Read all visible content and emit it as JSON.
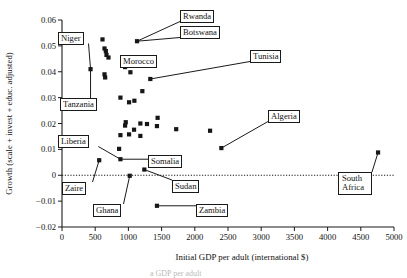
{
  "figure": {
    "type": "scatter-plot",
    "background": "#ffffff",
    "marker_color": "#161616",
    "axis_color": "#1a1a1a",
    "bottom_caption": "a GDP per adult"
  },
  "chart_data": {
    "type": "scatter",
    "title": "",
    "xlabel": "Initial GDP per adult (international $)",
    "ylabel": "Growth (scale + invest + educ. adjusted)",
    "xlim": [
      0,
      5000
    ],
    "ylim": [
      -0.02,
      0.06
    ],
    "xticks": [
      0,
      500,
      1000,
      1500,
      2000,
      2500,
      3000,
      3500,
      4000,
      4500,
      5000
    ],
    "xtick_labels": [
      "0",
      "500",
      "1000",
      "1500",
      "2000",
      "2500",
      "3000",
      "3500",
      "4000",
      "4500",
      "5000"
    ],
    "yticks": [
      -0.02,
      -0.01,
      0,
      0.01,
      0.02,
      0.03,
      0.04,
      0.05,
      0.06
    ],
    "ytick_labels": [
      "−0.02",
      "−0.01",
      "0",
      "0.01",
      "0.02",
      "0.03",
      "0.04",
      "0.05",
      "0.06"
    ],
    "grid": false,
    "legend": "none",
    "reference_line": {
      "y": 0,
      "style": "dotted"
    },
    "points": [
      {
        "x": 610,
        "y": 0.0525
      },
      {
        "x": 640,
        "y": 0.049
      },
      {
        "x": 660,
        "y": 0.048
      },
      {
        "x": 670,
        "y": 0.0465
      },
      {
        "x": 700,
        "y": 0.0455
      },
      {
        "x": 430,
        "y": 0.041
      },
      {
        "x": 640,
        "y": 0.039
      },
      {
        "x": 650,
        "y": 0.0378
      },
      {
        "x": 1130,
        "y": 0.0518
      },
      {
        "x": 1290,
        "y": 0.0455
      },
      {
        "x": 1110,
        "y": 0.0432
      },
      {
        "x": 950,
        "y": 0.0418
      },
      {
        "x": 1030,
        "y": 0.0398
      },
      {
        "x": 1330,
        "y": 0.0372
      },
      {
        "x": 1210,
        "y": 0.0325
      },
      {
        "x": 880,
        "y": 0.03
      },
      {
        "x": 1090,
        "y": 0.0288
      },
      {
        "x": 1010,
        "y": 0.0282
      },
      {
        "x": 1440,
        "y": 0.0222
      },
      {
        "x": 960,
        "y": 0.0205
      },
      {
        "x": 1180,
        "y": 0.02
      },
      {
        "x": 1280,
        "y": 0.0198
      },
      {
        "x": 950,
        "y": 0.0192
      },
      {
        "x": 1430,
        "y": 0.019
      },
      {
        "x": 1085,
        "y": 0.0176
      },
      {
        "x": 1720,
        "y": 0.0178
      },
      {
        "x": 2230,
        "y": 0.0172
      },
      {
        "x": 1010,
        "y": 0.0158
      },
      {
        "x": 1180,
        "y": 0.0152
      },
      {
        "x": 880,
        "y": 0.0155
      },
      {
        "x": 860,
        "y": 0.0102
      },
      {
        "x": 880,
        "y": 0.0062
      },
      {
        "x": 560,
        "y": 0.0058
      },
      {
        "x": 1240,
        "y": 0.0022
      },
      {
        "x": 1020,
        "y": -0.0002
      },
      {
        "x": 2400,
        "y": 0.0105
      },
      {
        "x": 1430,
        "y": -0.0118
      },
      {
        "x": 4760,
        "y": 0.0088
      }
    ],
    "annotations": [
      {
        "label": "Rwanda",
        "box_x": 180,
        "box_y": 10,
        "target_x": 1130,
        "target_y": 0.0518,
        "lines": 1
      },
      {
        "label": "Botswana",
        "box_x": 180,
        "box_y": 26,
        "target_x": 1130,
        "target_y": 0.0518,
        "lines": 1
      },
      {
        "label": "Niger",
        "box_x": 58,
        "box_y": 32,
        "target_x": 430,
        "target_y": 0.041,
        "lines": 1
      },
      {
        "label": "Morocco",
        "box_x": 120,
        "box_y": 55,
        "target_x": 1290,
        "target_y": 0.0455,
        "lines": 1
      },
      {
        "label": "Tunisia",
        "box_x": 250,
        "box_y": 50,
        "target_x": 1330,
        "target_y": 0.0372,
        "lines": 1
      },
      {
        "label": "Tanzania",
        "box_x": 60,
        "box_y": 98,
        "target_x": 430,
        "target_y": 0.041,
        "lines": 1
      },
      {
        "label": "Algeria",
        "box_x": 268,
        "box_y": 110,
        "target_x": 2400,
        "target_y": 0.0105,
        "lines": 1
      },
      {
        "label": "Liberia",
        "box_x": 58,
        "box_y": 135,
        "target_x": 880,
        "target_y": 0.0062,
        "lines": 1
      },
      {
        "label": "Somalia",
        "box_x": 148,
        "box_y": 155,
        "target_x": 880,
        "target_y": 0.0062,
        "lines": 1
      },
      {
        "label": "Sudan",
        "box_x": 172,
        "box_y": 180,
        "target_x": 1240,
        "target_y": 0.0022,
        "lines": 1
      },
      {
        "label": "Zaire",
        "box_x": 62,
        "box_y": 182,
        "target_x": 560,
        "target_y": 0.0058,
        "lines": 1
      },
      {
        "label": "Ghana",
        "box_x": 93,
        "box_y": 204,
        "target_x": 1020,
        "target_y": -0.0002,
        "lines": 1
      },
      {
        "label": "Zambia",
        "box_x": 196,
        "box_y": 204,
        "target_x": 1430,
        "target_y": -0.0118,
        "lines": 1
      },
      {
        "label": "South\nAfrica",
        "box_x": 338,
        "box_y": 172,
        "target_x": 4760,
        "target_y": 0.0088,
        "lines": 2
      }
    ]
  }
}
